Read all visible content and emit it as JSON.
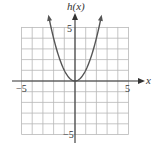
{
  "chart_data": {
    "type": "line",
    "title": "",
    "function": "h(x) = x^2",
    "xlabel": "x",
    "ylabel": "h(x)",
    "xlim": [
      -5,
      5
    ],
    "ylim": [
      -5,
      5
    ],
    "grid": true,
    "grid_step": 1,
    "tick_labels": {
      "x": [
        {
          "value": -5,
          "label": "−5"
        },
        {
          "value": 5,
          "label": "5"
        }
      ],
      "y": [
        {
          "value": 5,
          "label": "5"
        },
        {
          "value": -5,
          "label": "−5"
        }
      ]
    },
    "series": [
      {
        "name": "h(x)",
        "x": [
          -2.45,
          -2,
          -1.5,
          -1,
          -0.5,
          0,
          0.5,
          1,
          1.5,
          2,
          2.45
        ],
        "y": [
          6,
          4,
          2.25,
          1,
          0.25,
          0,
          0.25,
          1,
          2.25,
          4,
          6
        ],
        "arrows_at_ends": true
      }
    ],
    "legend": null,
    "colors": {
      "grid": "#b8b8b8",
      "axis": "#333333",
      "curve": "#555555"
    }
  },
  "labels": {
    "y_axis": "h(x)",
    "x_axis": "x",
    "x_min": "−5",
    "x_max": "5",
    "y_max": "5",
    "y_min": "−5"
  }
}
